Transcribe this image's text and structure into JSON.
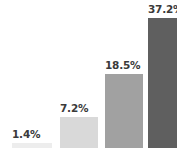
{
  "chart_data": {
    "type": "bar",
    "title": "",
    "subtitle": "",
    "xlabel": "",
    "ylabel": "",
    "categories": [
      "",
      "",
      "",
      ""
    ],
    "values": [
      1.4,
      7.2,
      18.5,
      37.2
    ],
    "value_labels": [
      "1.4%",
      "7.2%",
      "18.5%",
      "37.2%"
    ],
    "value_unit": "%",
    "ylim": [
      0,
      42
    ],
    "grid": false,
    "legend": false,
    "legend_position": "none",
    "axis_visible": false,
    "tick_labels_x": [],
    "tick_labels_y": [],
    "annotations": [],
    "bar_colors": [
      "#ededed",
      "#d9d9d9",
      "#a1a1a1",
      "#5f5f5f"
    ],
    "label_color": "#3a3a3a",
    "background_color": "#ffffff",
    "label_position": "above-bar"
  },
  "bars": [
    {
      "label": "1.4%",
      "value": 1.4,
      "color": "#ededed"
    },
    {
      "label": "7.2%",
      "value": 7.2,
      "color": "#d9d9d9"
    },
    {
      "label": "18.5%",
      "value": 18.5,
      "color": "#a1a1a1"
    },
    {
      "label": "37.2%",
      "value": 37.2,
      "color": "#5f5f5f"
    }
  ]
}
